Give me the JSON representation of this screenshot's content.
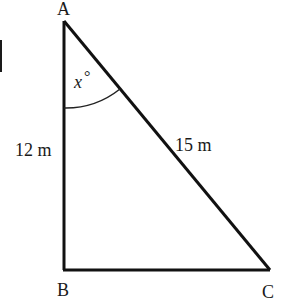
{
  "diagram": {
    "type": "right-triangle",
    "vertices": {
      "A": {
        "label": "A"
      },
      "B": {
        "label": "B"
      },
      "C": {
        "label": "C"
      }
    },
    "sides": {
      "AB": {
        "label": "12 m"
      },
      "AC": {
        "label": "15 m"
      }
    },
    "angle": {
      "at": "A",
      "label_var": "x",
      "label_unit": "°"
    }
  }
}
